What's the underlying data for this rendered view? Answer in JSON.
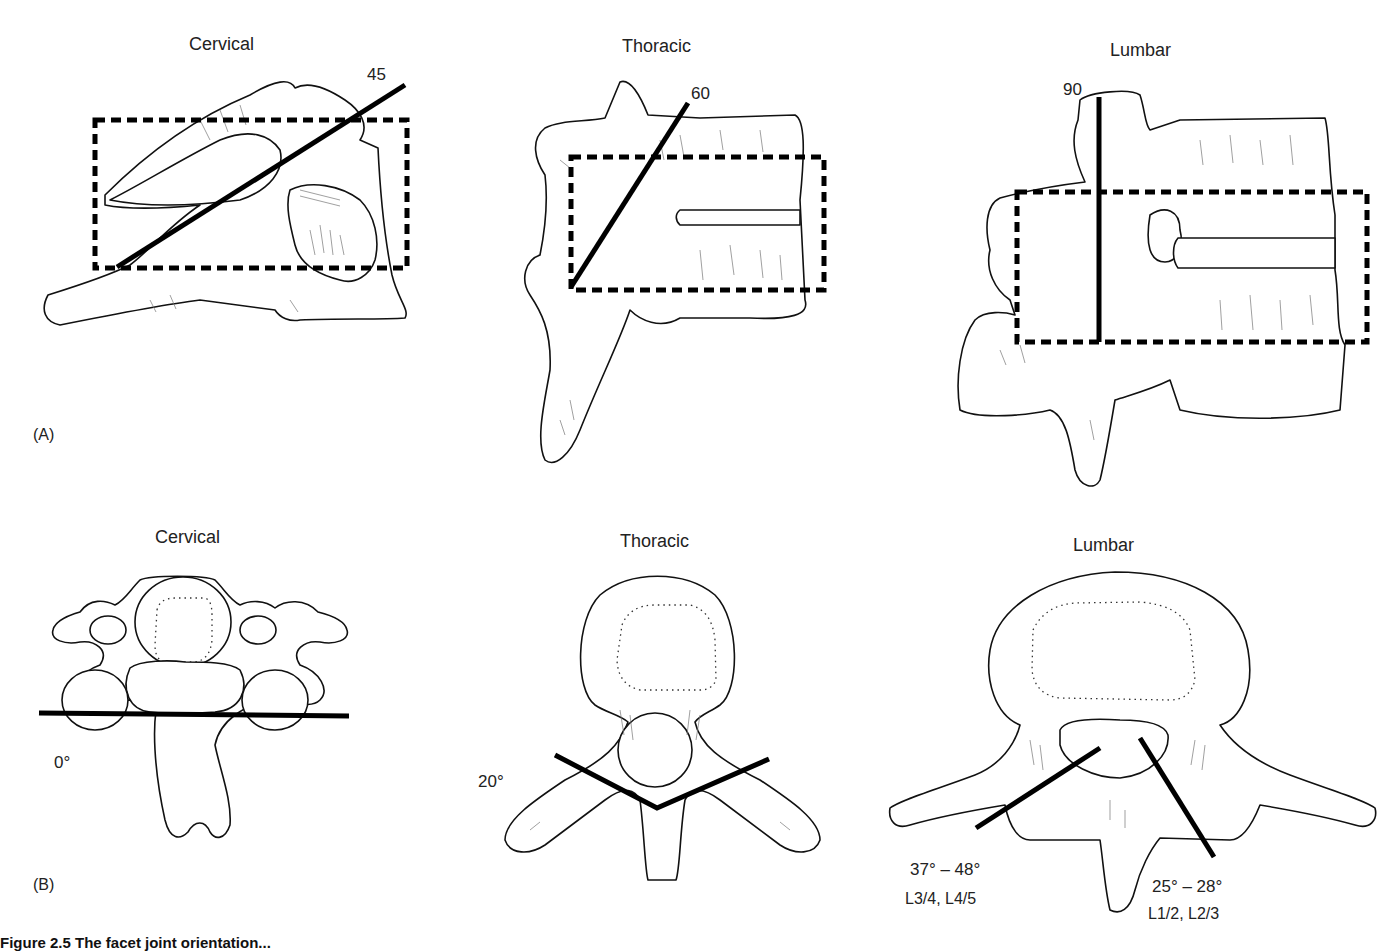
{
  "panel_a": {
    "label": "(A)",
    "views": [
      {
        "title": "Cervical",
        "angle": "45"
      },
      {
        "title": "Thoracic",
        "angle": "60"
      },
      {
        "title": "Lumbar",
        "angle": "90"
      }
    ]
  },
  "panel_b": {
    "label": "(B)",
    "views": [
      {
        "title": "Cervical",
        "angle": "0°"
      },
      {
        "title": "Thoracic",
        "angle": "20°"
      },
      {
        "title": "Lumbar",
        "angle_left": "37° – 48°",
        "levels_left": "L3/4, L4/5",
        "angle_right": "25° – 28°",
        "levels_right": "L1/2, L2/3"
      }
    ]
  },
  "caption": "Figure 2.5  The facet joint orientation..."
}
